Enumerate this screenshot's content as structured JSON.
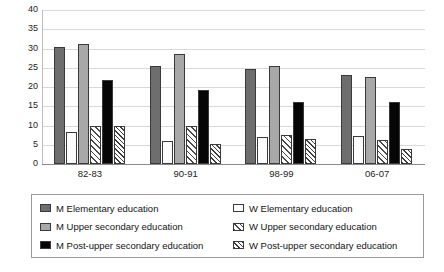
{
  "chart_data": {
    "type": "bar",
    "title": "",
    "subtitle": "",
    "xlabel": "",
    "ylabel": "",
    "ylim": [
      0,
      40
    ],
    "yticks": [
      0,
      5,
      10,
      15,
      20,
      25,
      30,
      35,
      40
    ],
    "ytick_labels": [
      "0",
      "5",
      "10",
      "15",
      "20",
      "25",
      "30",
      "35",
      "40"
    ],
    "grid": true,
    "grid_axis": "y",
    "legend_position": "bottom",
    "legend_columns": 2,
    "categories": [
      "82-83",
      "90-91",
      "98-99",
      "06-07"
    ],
    "series": [
      {
        "name": "M Elementary education",
        "key": "m-elementary",
        "pattern": "solid-dark-gray",
        "color": "#6e6e6e",
        "values": [
          30.5,
          25.5,
          24.8,
          23.2
        ]
      },
      {
        "name": "W Elementary education",
        "key": "w-elementary",
        "pattern": "solid-white",
        "color": "#fbfbfb",
        "values": [
          8.3,
          6.1,
          7.1,
          7.4
        ]
      },
      {
        "name": "M Upper secondary education",
        "key": "m-upper-secondary",
        "pattern": "solid-light-gray",
        "color": "#a8a8a8",
        "values": [
          31.1,
          28.5,
          25.5,
          22.5
        ]
      },
      {
        "name": "W Upper secondary education",
        "key": "w-upper-secondary",
        "pattern": "diagonal-hatch",
        "color": "#ffffff",
        "values": [
          10.0,
          9.8,
          7.5,
          6.3
        ]
      },
      {
        "name": "M Post-upper secondary education",
        "key": "m-post-upper-secondary",
        "pattern": "solid-black",
        "color": "#060606",
        "values": [
          21.8,
          19.3,
          16.2,
          16.2
        ]
      },
      {
        "name": "W Post-upper secondary education",
        "key": "w-post-upper-secondary",
        "pattern": "dense-diagonal-hatch",
        "color": "#ffffff",
        "values": [
          10.0,
          5.1,
          6.5,
          4.0
        ]
      }
    ]
  },
  "legend": {
    "left_column": [
      "M Elementary education",
      "M Upper secondary education",
      "M Post-upper secondary education"
    ],
    "right_column": [
      "W Elementary education",
      "W Upper secondary education",
      "W Post-upper secondary education"
    ]
  },
  "colors": {
    "m_elementary": "#6e6e6e",
    "w_elementary": "#fbfbfb",
    "m_upper_secondary": "#a8a8a8",
    "w_upper_secondary": "#ffffff",
    "m_post_upper_secondary": "#060606",
    "w_post_upper_secondary": "#ffffff",
    "gridline": "#d9d9d9",
    "axis": "#8a8a8a",
    "legend_border": "#9a9a9a",
    "text": "#1a1a1a",
    "background": "#ffffff"
  }
}
